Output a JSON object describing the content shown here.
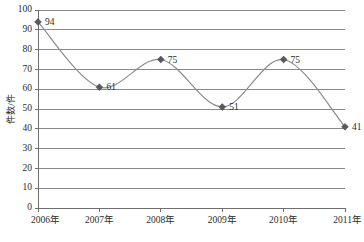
{
  "chart_data": {
    "type": "line",
    "title": "",
    "subtitle": "",
    "xlabel": "",
    "ylabel": "件数/件",
    "categories": [
      "2006年",
      "2007年",
      "2008年",
      "2009年",
      "2010年",
      "2011年"
    ],
    "values": [
      94,
      61,
      75,
      51,
      75,
      41
    ],
    "series": [
      {
        "name": "件数",
        "values": [
          94,
          61,
          75,
          51,
          75,
          41
        ]
      }
    ],
    "data_labels": [
      "94",
      "61",
      "75",
      "51",
      "75",
      "41"
    ],
    "ylim": [
      0,
      100
    ],
    "ytick_step": 10,
    "yticks": [
      "0",
      "10",
      "20",
      "30",
      "40",
      "50",
      "60",
      "70",
      "80",
      "90",
      "100"
    ],
    "grid": "horizontal",
    "legend": "none",
    "smooth": true,
    "marker": "diamond",
    "colors": {
      "line": "#8c8c8c",
      "marker": "#59595f",
      "grid": "#8a8a8a",
      "axis": "#6f6f6f",
      "text": "#2b2b2b",
      "background": "#ffffff"
    }
  },
  "axis": {
    "y_title": "件数/件"
  }
}
